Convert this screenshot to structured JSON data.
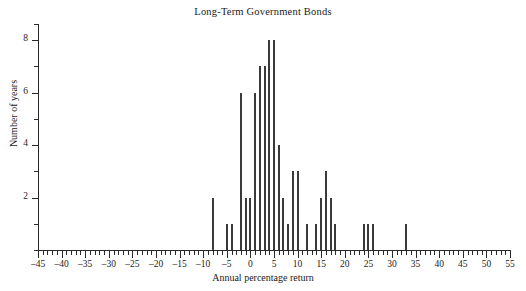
{
  "chart_data": {
    "type": "bar",
    "title": "Long-Term Government Bonds",
    "xlabel": "Annual percentage return",
    "ylabel": "Number of years",
    "xlim": [
      -45,
      55
    ],
    "ylim": [
      0,
      8
    ],
    "x_tick_step": 5,
    "x_minor_tick_step": 1,
    "y_tick_step": 2,
    "y_minor_tick_step": 1,
    "grid": false,
    "legend": null,
    "bar_color": "#3a3a3a",
    "x_tick_labels": [
      "-45",
      "-40",
      "-35",
      "-30",
      "-25",
      "-20",
      "-15",
      "-10",
      "-5",
      "0",
      "5",
      "10",
      "15",
      "20",
      "25",
      "30",
      "35",
      "40",
      "45",
      "50",
      "55"
    ],
    "y_tick_labels": [
      "2",
      "4",
      "6",
      "8"
    ],
    "categories": [
      -8,
      -5,
      -4,
      -2,
      -1,
      0,
      1,
      2,
      3,
      4,
      5,
      6,
      7,
      8,
      9,
      10,
      12,
      14,
      15,
      16,
      17,
      18,
      24,
      25,
      26,
      33
    ],
    "values": [
      2,
      1,
      1,
      6,
      2,
      2,
      6,
      7,
      7,
      8,
      8,
      4,
      2,
      1,
      3,
      3,
      1,
      1,
      2,
      3,
      2,
      1,
      1,
      1,
      1,
      1
    ]
  }
}
